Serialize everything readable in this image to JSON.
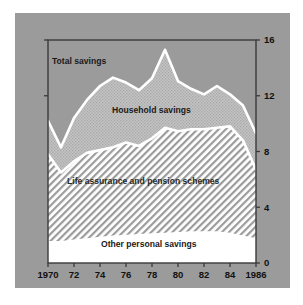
{
  "chart_data": {
    "type": "area",
    "stacked": true,
    "title": "",
    "subtitle": "",
    "xlabel": "",
    "ylabel": "",
    "xlim": [
      1970,
      1986
    ],
    "ylim": [
      0,
      16
    ],
    "grid": false,
    "legend_position": "inline-annotations",
    "y_ticks": [
      "0",
      "4",
      "8",
      "12",
      "16"
    ],
    "y_tick_values": [
      0,
      4,
      8,
      12,
      16
    ],
    "x_ticks": [
      "1970",
      "72",
      "74",
      "76",
      "78",
      "80",
      "82",
      "84",
      "1986"
    ],
    "x_tick_values": [
      1970,
      1972,
      1974,
      1976,
      1978,
      1980,
      1982,
      1984,
      1986
    ],
    "x": [
      1970,
      1971,
      1972,
      1973,
      1974,
      1975,
      1976,
      1977,
      1978,
      1979,
      1980,
      1981,
      1982,
      1983,
      1984,
      1985,
      1986
    ],
    "series": [
      {
        "name": "Other personal savings",
        "values": [
          1.5,
          1.5,
          1.6,
          1.7,
          1.8,
          1.9,
          1.95,
          2.0,
          2.05,
          2.1,
          2.15,
          2.2,
          2.2,
          2.2,
          2.1,
          1.9,
          1.7
        ]
      },
      {
        "name": "Life assurance and pension schemes",
        "values": [
          6.3,
          5.0,
          5.7,
          6.2,
          6.3,
          6.4,
          6.7,
          6.4,
          6.9,
          7.6,
          7.3,
          7.4,
          7.4,
          7.5,
          7.7,
          6.9,
          5.0
        ]
      },
      {
        "name": "Household savings",
        "values": [
          2.4,
          1.8,
          3.1,
          3.8,
          4.6,
          5.0,
          4.3,
          4.0,
          4.3,
          5.6,
          3.6,
          2.9,
          2.5,
          3.0,
          2.3,
          2.5,
          2.6
        ]
      }
    ],
    "cumulative_total_savings": [
      10.2,
      8.3,
      10.4,
      11.7,
      12.7,
      13.3,
      12.95,
      12.4,
      13.25,
      15.3,
      13.05,
      12.5,
      12.1,
      12.7,
      12.1,
      11.3,
      9.3
    ],
    "cumulative_life_assurance_top": [
      7.8,
      6.5,
      7.3,
      7.9,
      8.1,
      8.3,
      8.65,
      8.4,
      8.95,
      9.7,
      9.45,
      9.6,
      9.6,
      9.7,
      9.8,
      8.8,
      6.7
    ],
    "annotations": [
      {
        "text": "Total savings",
        "x_px": 52,
        "y_px": 64
      },
      {
        "text": "Household savings",
        "x_px": 112,
        "y_px": 113
      },
      {
        "text": "Life assurance and pension schemes",
        "x_px": 67,
        "y_px": 184
      },
      {
        "text": "Other personal savings",
        "x_px": 101,
        "y_px": 247
      }
    ]
  },
  "colors": {
    "background": "#ffffff",
    "panel": "#9b9b9b",
    "plot_border": "#3a3a3a",
    "total_band": "#a6a6a6",
    "household_band": "#c8c8c8",
    "life_assurance_band": "#ffffff",
    "other_band": "#ffffff",
    "hatch": "#9b9b9b",
    "separator": "#ffffff",
    "text": "#111111"
  },
  "plot_geometry": {
    "left_px": 48,
    "right_px": 256,
    "top_px": 40,
    "bottom_px": 263
  }
}
